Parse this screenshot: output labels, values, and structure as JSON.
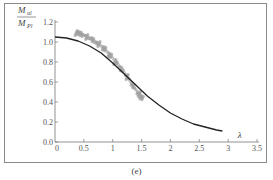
{
  "chart_data": {
    "type": "line",
    "title": "",
    "caption": "(e)",
    "xlabel": "λ",
    "ylabel_num": "M",
    "ylabel_num_sub": "ul",
    "ylabel_den": "M",
    "ylabel_den_sub": "Pl",
    "xlim": [
      0,
      3.5
    ],
    "ylim": [
      0,
      1.2
    ],
    "xticks": [
      "0",
      "0.5",
      "1",
      "1.5",
      "2",
      "2.5",
      "3",
      "3.5"
    ],
    "yticks": [
      "0.0",
      "0.2",
      "0.4",
      "0.6",
      "0.8",
      "1.0",
      "1.2"
    ],
    "grid": false,
    "legend": "none",
    "series": [
      {
        "name": "design curve",
        "style": "solid line",
        "color": "#222222",
        "x": [
          0,
          0.2,
          0.4,
          0.6,
          0.8,
          1.0,
          1.2,
          1.4,
          1.6,
          1.8,
          2.0,
          2.2,
          2.4,
          2.6,
          2.8,
          2.9
        ],
        "y": [
          1.05,
          1.04,
          1.01,
          0.96,
          0.89,
          0.79,
          0.68,
          0.57,
          0.46,
          0.37,
          0.29,
          0.23,
          0.18,
          0.15,
          0.12,
          0.11
        ]
      },
      {
        "name": "test/FE results",
        "style": "scatter band",
        "color": "#8c8c8c",
        "x": [
          0.38,
          0.45,
          0.55,
          0.65,
          0.75,
          0.85,
          0.95,
          1.05,
          1.15,
          1.25,
          1.35,
          1.45,
          1.5
        ],
        "y": [
          1.08,
          1.07,
          1.04,
          1.01,
          0.97,
          0.92,
          0.86,
          0.79,
          0.72,
          0.64,
          0.55,
          0.47,
          0.43
        ]
      }
    ]
  }
}
